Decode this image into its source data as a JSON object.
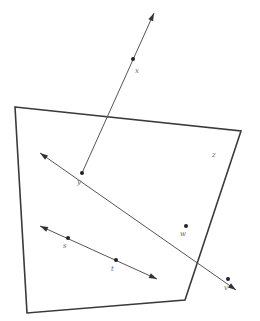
{
  "diagram": {
    "type": "geometry",
    "polygon": {
      "name": "quadrilateral",
      "vertices": [
        [
          15,
          107
        ],
        [
          241,
          131
        ],
        [
          185,
          300
        ],
        [
          27,
          313
        ]
      ]
    },
    "lines": [
      {
        "name": "line-xy",
        "from": [
          82,
          173
        ],
        "to": [
          154,
          13
        ],
        "arrow_start": false,
        "arrow_end": true
      },
      {
        "name": "line-ywv",
        "from": [
          40,
          153
        ],
        "to": [
          236,
          290
        ],
        "arrow_start": true,
        "arrow_end": true
      },
      {
        "name": "line-st",
        "from": [
          40,
          226
        ],
        "to": [
          157,
          279
        ],
        "arrow_start": true,
        "arrow_end": true
      }
    ],
    "points": [
      {
        "id": "x",
        "label": "x",
        "pos": [
          133,
          59
        ],
        "label_pos": [
          135,
          73
        ]
      },
      {
        "id": "y",
        "label": "y",
        "pos": [
          82,
          173
        ],
        "label_pos": [
          77,
          184
        ]
      },
      {
        "id": "z",
        "label": "z",
        "pos": null,
        "label_pos": [
          212,
          157
        ]
      },
      {
        "id": "w",
        "label": "w",
        "pos": [
          186,
          226
        ],
        "label_pos": [
          180,
          236
        ]
      },
      {
        "id": "v",
        "label": "v",
        "pos": [
          228,
          279
        ],
        "label_pos": [
          224,
          290
        ]
      },
      {
        "id": "s",
        "label": "s",
        "pos": [
          68,
          238
        ],
        "label_pos": [
          63,
          248
        ]
      },
      {
        "id": "t",
        "label": "t",
        "pos": [
          116,
          260
        ],
        "label_pos": [
          111,
          271
        ]
      }
    ],
    "colors": {
      "background": "#ffffff",
      "polygon_stroke": "#3a3a3a",
      "line_stroke": "#555555",
      "point_fill": "#222222",
      "label_fill": "#666666"
    }
  }
}
